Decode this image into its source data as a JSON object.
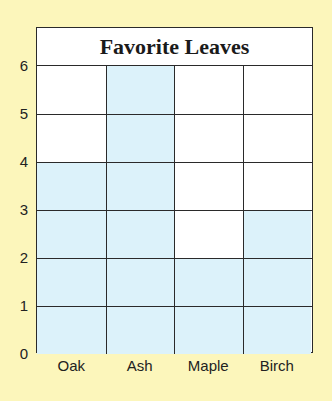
{
  "chart_data": {
    "type": "bar",
    "title": "Favorite Leaves",
    "categories": [
      "Oak",
      "Ash",
      "Maple",
      "Birch"
    ],
    "values": [
      4,
      6,
      2,
      3
    ],
    "xlabel": "",
    "ylabel": "",
    "ylim": [
      0,
      6
    ],
    "yticks": [
      0,
      1,
      2,
      3,
      4,
      5,
      6
    ],
    "grid": true,
    "bar_color": "#dcf2fa",
    "background_color": "#fcf6bb",
    "legend": null
  }
}
